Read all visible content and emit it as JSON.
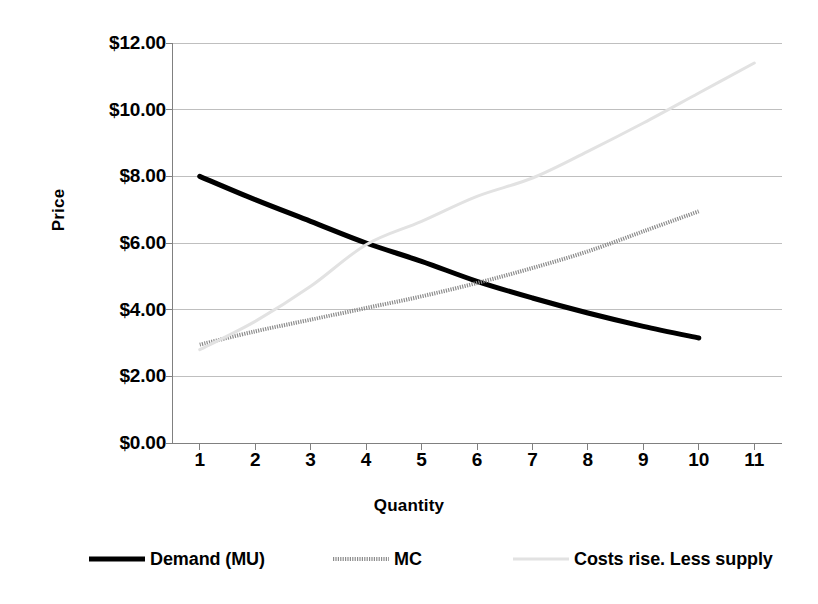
{
  "chart_data": {
    "type": "line",
    "title": "",
    "xlabel": "Quantity",
    "ylabel": "Price",
    "xlim": [
      0.5,
      11.5
    ],
    "ylim": [
      0,
      12
    ],
    "grid": true,
    "grid_axis": "y",
    "legend_position": "bottom",
    "x_tick_labels": [
      "1",
      "2",
      "3",
      "4",
      "5",
      "6",
      "7",
      "8",
      "9",
      "10",
      "11"
    ],
    "x_tick_values": [
      1,
      2,
      3,
      4,
      5,
      6,
      7,
      8,
      9,
      10,
      11
    ],
    "y_tick_labels": [
      "$0.00",
      "$2.00",
      "$4.00",
      "$6.00",
      "$8.00",
      "$10.00",
      "$12.00"
    ],
    "y_tick_values": [
      0,
      2,
      4,
      6,
      8,
      10,
      12
    ],
    "series": [
      {
        "name": "Demand (MU)",
        "color": "#000000",
        "style": "solid",
        "width": 5,
        "x": [
          1,
          2,
          3,
          4,
          5,
          6,
          7,
          8,
          9,
          10
        ],
        "values": [
          8.0,
          7.3,
          6.65,
          6.0,
          5.45,
          4.85,
          4.35,
          3.9,
          3.5,
          3.15
        ]
      },
      {
        "name": "MC",
        "color": "#8c8c8c",
        "style": "dotted",
        "width": 4,
        "x": [
          1,
          2,
          3,
          4,
          5,
          6,
          7,
          8,
          9,
          10
        ],
        "values": [
          2.95,
          3.35,
          3.7,
          4.05,
          4.4,
          4.8,
          5.25,
          5.75,
          6.35,
          6.95
        ]
      },
      {
        "name": "Costs rise. Less supply",
        "color": "#e2e2e2",
        "style": "solid",
        "width": 3,
        "x": [
          1,
          2,
          3,
          4,
          5,
          6,
          7,
          8,
          9,
          10,
          11
        ],
        "values": [
          2.8,
          3.65,
          4.7,
          5.95,
          6.65,
          7.4,
          7.95,
          8.75,
          9.6,
          10.5,
          11.4
        ]
      }
    ],
    "annotations": [],
    "colors": {
      "axis": "#808080",
      "gridline": "#bfbfbf",
      "background": "#ffffff",
      "text": "#000000"
    }
  },
  "legend": {
    "entries": [
      {
        "label": "Demand (MU)",
        "swatch": "solid-black-line"
      },
      {
        "label": "MC",
        "swatch": "dotted-gray-line"
      },
      {
        "label": "Costs rise. Less supply",
        "swatch": "faint-gray-line"
      }
    ]
  },
  "axes": {
    "y_title": "Price",
    "x_title": "Quantity"
  }
}
